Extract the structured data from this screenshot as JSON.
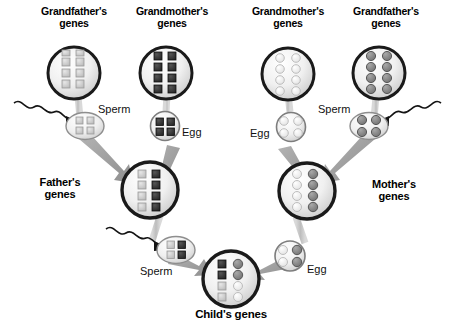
{
  "figure": {
    "kind": "genetics-inheritance-diagram",
    "background_color": "#ffffff",
    "width": 453,
    "height": 332
  },
  "labels": {
    "gf_left": "Grandfather's\ngenes",
    "gm_left": "Grandmother's\ngenes",
    "gm_right": "Grandmother's\ngenes",
    "gf_right": "Grandfather's\ngenes",
    "father": "Father's\ngenes",
    "mother": "Mother's\ngenes",
    "child": "Child's genes",
    "sperm_left": "Sperm",
    "egg_left": "Egg",
    "egg_right": "Egg",
    "sperm_right": "Sperm",
    "sperm_father": "Sperm",
    "egg_mother": "Egg"
  },
  "colors": {
    "gene_light": "#cfcfcf",
    "gene_dark": "#3b3b3b",
    "gene_white": "#f2f2f2",
    "gene_mid": "#8a8a8a",
    "cell_outline": "#1a1a1a",
    "cell_fill_a": "#f7f7f7",
    "cell_fill_b": "#d8d8d8",
    "arrow": "#9a9a9a",
    "stalk": "#c4c4c4",
    "tail": "#141414",
    "text": "#000000"
  },
  "cells": {
    "gf_left": {
      "name": "grandfather-left-cell",
      "shape": "circle",
      "radius": 26,
      "gene_shape": "square",
      "rows": 4,
      "cols": 2,
      "pattern": [
        [
          "light",
          "light"
        ],
        [
          "light",
          "light"
        ],
        [
          "light",
          "light"
        ],
        [
          "light",
          "light"
        ]
      ]
    },
    "gm_left": {
      "name": "grandmother-left-cell",
      "shape": "circle",
      "radius": 26,
      "gene_shape": "square",
      "rows": 4,
      "cols": 2,
      "pattern": [
        [
          "dark",
          "dark"
        ],
        [
          "dark",
          "dark"
        ],
        [
          "dark",
          "dark"
        ],
        [
          "dark",
          "dark"
        ]
      ]
    },
    "gm_right": {
      "name": "grandmother-right-cell",
      "shape": "circle",
      "radius": 26,
      "gene_shape": "circle",
      "rows": 4,
      "cols": 2,
      "pattern": [
        [
          "white",
          "white"
        ],
        [
          "white",
          "white"
        ],
        [
          "white",
          "white"
        ],
        [
          "white",
          "white"
        ]
      ]
    },
    "gf_right": {
      "name": "grandfather-right-cell",
      "shape": "circle",
      "radius": 26,
      "gene_shape": "circle",
      "rows": 4,
      "cols": 2,
      "pattern": [
        [
          "mid",
          "mid"
        ],
        [
          "mid",
          "mid"
        ],
        [
          "mid",
          "mid"
        ],
        [
          "mid",
          "mid"
        ]
      ]
    },
    "sperm_left": {
      "name": "sperm-from-grandfather-left",
      "shape": "ellipse",
      "gene_shape": "square",
      "rows": 2,
      "cols": 2,
      "pattern": [
        [
          "light",
          "light"
        ],
        [
          "light",
          "light"
        ]
      ]
    },
    "egg_left": {
      "name": "egg-from-grandmother-left",
      "shape": "circle",
      "radius": 14,
      "gene_shape": "square",
      "rows": 2,
      "cols": 2,
      "pattern": [
        [
          "dark",
          "dark"
        ],
        [
          "dark",
          "dark"
        ]
      ]
    },
    "egg_right": {
      "name": "egg-from-grandmother-right",
      "shape": "circle",
      "radius": 14,
      "gene_shape": "circle",
      "rows": 2,
      "cols": 2,
      "pattern": [
        [
          "white",
          "white"
        ],
        [
          "white",
          "white"
        ]
      ]
    },
    "sperm_right": {
      "name": "sperm-from-grandfather-right",
      "shape": "ellipse",
      "gene_shape": "circle",
      "rows": 2,
      "cols": 2,
      "pattern": [
        [
          "mid",
          "mid"
        ],
        [
          "mid",
          "mid"
        ]
      ]
    },
    "father": {
      "name": "father-cell",
      "shape": "circle",
      "radius": 28,
      "gene_shape": "square",
      "rows": 4,
      "cols": 2,
      "pattern": [
        [
          "light",
          "dark"
        ],
        [
          "light",
          "dark"
        ],
        [
          "light",
          "dark"
        ],
        [
          "light",
          "dark"
        ]
      ]
    },
    "mother": {
      "name": "mother-cell",
      "shape": "circle",
      "radius": 28,
      "gene_shape": "circle",
      "rows": 4,
      "cols": 2,
      "pattern": [
        [
          "white",
          "mid"
        ],
        [
          "white",
          "mid"
        ],
        [
          "white",
          "mid"
        ],
        [
          "white",
          "mid"
        ]
      ]
    },
    "sperm_father": {
      "name": "sperm-from-father",
      "shape": "ellipse",
      "gene_shape": "square",
      "rows": 2,
      "cols": 2,
      "pattern": [
        [
          "light",
          "dark"
        ],
        [
          "light",
          "dark"
        ]
      ]
    },
    "egg_mother": {
      "name": "egg-from-mother",
      "shape": "circle",
      "radius": 14,
      "gene_shape": "circle",
      "rows": 2,
      "cols": 2,
      "pattern": [
        [
          "white",
          "mid"
        ],
        [
          "white",
          "mid"
        ]
      ]
    },
    "child": {
      "name": "child-cell",
      "shape": "circle",
      "radius": 28,
      "gene_shape": "mixed",
      "rows": 4,
      "cols": 2,
      "pattern": [
        [
          "dark-square",
          "mid-circle"
        ],
        [
          "dark-square",
          "mid-circle"
        ],
        [
          "light-square",
          "white-circle"
        ],
        [
          "light-square",
          "white-circle"
        ]
      ]
    }
  }
}
